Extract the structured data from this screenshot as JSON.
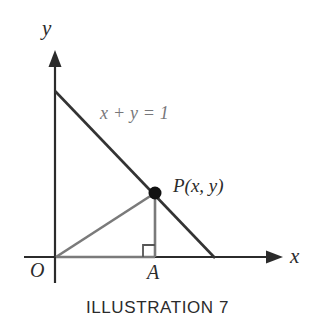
{
  "figure": {
    "caption": "ILLUSTRATION 7",
    "axes": {
      "y_label": "y",
      "x_label": "x",
      "origin_label": "O"
    },
    "labels": {
      "line_equation": "x + y = 1",
      "point_p": "P(x, y)",
      "foot_point": "A"
    },
    "colors": {
      "axis": "#2b2b2b",
      "line_dark": "#333333",
      "triangle_gray": "#7a7a7a",
      "equation_text": "#77777a",
      "label_text": "#2b2b2b",
      "background": "#ffffff"
    },
    "geometry": {
      "origin": {
        "x": 55,
        "y": 258
      },
      "y_intercept": {
        "x": 55,
        "y": 91
      },
      "x_intercept": {
        "x": 215,
        "y": 258
      },
      "point_p": {
        "x": 155,
        "y": 193
      },
      "point_a": {
        "x": 155,
        "y": 258
      },
      "y_axis_top": {
        "x": 55,
        "y": 50
      },
      "y_axis_bottom": {
        "x": 55,
        "y": 283
      },
      "x_axis_left": {
        "x": 24,
        "y": 257
      },
      "x_axis_right": {
        "x": 283,
        "y": 257
      },
      "right_angle_size": 11,
      "point_radius": 6
    }
  }
}
